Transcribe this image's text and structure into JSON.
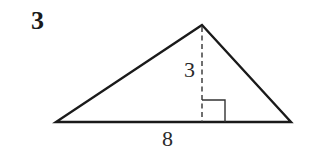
{
  "problem": {
    "number": "3"
  },
  "figure": {
    "shape": "triangle",
    "height_label": "3",
    "base_label": "8",
    "vertices": {
      "apex": [
        202,
        25
      ],
      "left": [
        56,
        122
      ],
      "right": [
        291,
        122
      ]
    },
    "right_angle_marker": true,
    "colors": {
      "stroke": "#1a1a1a",
      "background": "#ffffff"
    }
  }
}
